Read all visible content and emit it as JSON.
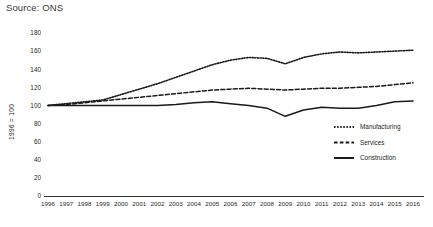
{
  "source_note": "Source: ONS",
  "chart_data": {
    "type": "line",
    "title": "",
    "subtitle": "",
    "xlabel": "",
    "ylabel": "1996 = 100",
    "ylim": [
      0,
      180
    ],
    "ytick_values": [
      0,
      20,
      40,
      60,
      80,
      100,
      120,
      140,
      160,
      180
    ],
    "ytick_labels": [
      "0",
      "20",
      "40",
      "60",
      "80",
      "100",
      "120",
      "140",
      "160",
      "180"
    ],
    "grid": false,
    "legend_position": "inside-right",
    "categories": [
      "1996",
      "1997",
      "1998",
      "1999",
      "2000",
      "2001",
      "2002",
      "2003",
      "2004",
      "2005",
      "2006",
      "2007",
      "2008",
      "2009",
      "2010",
      "2011",
      "2012",
      "2013",
      "2014",
      "2015",
      "2016"
    ],
    "x": [
      1996,
      1997,
      1998,
      1999,
      2000,
      2001,
      2002,
      2003,
      2004,
      2005,
      2006,
      2007,
      2008,
      2009,
      2010,
      2011,
      2012,
      2013,
      2014,
      2015,
      2016
    ],
    "series": [
      {
        "name": "Manufacturing",
        "style": "dotted",
        "values": [
          100,
          102,
          104,
          106,
          112,
          118,
          124,
          131,
          138,
          145,
          150,
          153,
          152,
          146,
          153,
          157,
          159,
          158,
          159,
          160,
          161
        ]
      },
      {
        "name": "Services",
        "style": "dashed",
        "values": [
          100,
          101,
          103,
          105,
          107,
          109,
          111,
          113,
          115,
          117,
          118,
          119,
          118,
          117,
          118,
          119,
          119,
          120,
          121,
          123,
          125
        ]
      },
      {
        "name": "Construction",
        "style": "solid",
        "values": [
          100,
          100,
          100,
          100,
          100,
          100,
          100,
          101,
          103,
          104,
          102,
          100,
          97,
          88,
          95,
          98,
          97,
          97,
          100,
          104,
          105
        ]
      }
    ]
  },
  "legend": {
    "items": [
      {
        "label": "Manufacturing",
        "style": "dotted"
      },
      {
        "label": "Services",
        "style": "dashed"
      },
      {
        "label": "Construction",
        "style": "solid"
      }
    ]
  },
  "colors": {
    "ink": "#1a1a1a",
    "text": "#231f20",
    "background": "#ffffff"
  }
}
